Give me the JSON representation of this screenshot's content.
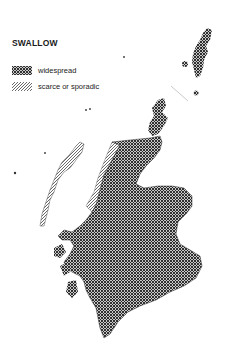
{
  "map": {
    "title": "SWALLOW",
    "region": "Scotland",
    "legend": [
      {
        "key": "widespread",
        "label": "widespread",
        "pattern": "cross-hatch",
        "color": "#2a2a2a"
      },
      {
        "key": "scarce",
        "label": "scarce or sporadic",
        "pattern": "diagonal-hatch",
        "color": "#555555"
      }
    ],
    "colors": {
      "background": "#ffffff",
      "ink": "#1a1a1a"
    }
  }
}
